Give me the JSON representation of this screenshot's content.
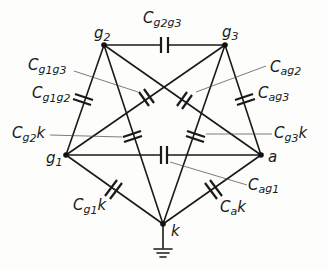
{
  "diagram": {
    "type": "electrode interelectrode capacitance network",
    "nodes": [
      {
        "id": "g2",
        "label": "g",
        "sub": "2"
      },
      {
        "id": "g3",
        "label": "g",
        "sub": "3"
      },
      {
        "id": "g1",
        "label": "g",
        "sub": "1"
      },
      {
        "id": "a",
        "label": "a",
        "sub": ""
      },
      {
        "id": "k",
        "label": "k",
        "sub": ""
      }
    ],
    "capacitors": [
      {
        "name": "Cg2g3",
        "main": "C",
        "parts": [
          "g",
          "2",
          "g",
          "3"
        ]
      },
      {
        "name": "Cg1g3",
        "main": "C",
        "parts": [
          "g",
          "1",
          "g",
          "3"
        ]
      },
      {
        "name": "Cg1g2",
        "main": "C",
        "parts": [
          "g",
          "1",
          "g",
          "2"
        ]
      },
      {
        "name": "Cag2",
        "main": "C",
        "parts": [
          "a",
          "",
          "g",
          "2"
        ]
      },
      {
        "name": "Cag3",
        "main": "C",
        "parts": [
          "a",
          "",
          "g",
          "3"
        ]
      },
      {
        "name": "Cg2k",
        "main": "C",
        "parts": [
          "g",
          "2",
          "k",
          ""
        ]
      },
      {
        "name": "Cg3k",
        "main": "C",
        "parts": [
          "g",
          "3",
          "k",
          ""
        ]
      },
      {
        "name": "Cag1",
        "main": "C",
        "parts": [
          "a",
          "",
          "g",
          "1"
        ]
      },
      {
        "name": "Cg1k",
        "main": "C",
        "parts": [
          "g",
          "1",
          "k",
          ""
        ]
      },
      {
        "name": "Cak",
        "main": "C",
        "parts": [
          "a",
          "",
          "k",
          ""
        ]
      }
    ],
    "ground": "ground-symbol at k"
  }
}
